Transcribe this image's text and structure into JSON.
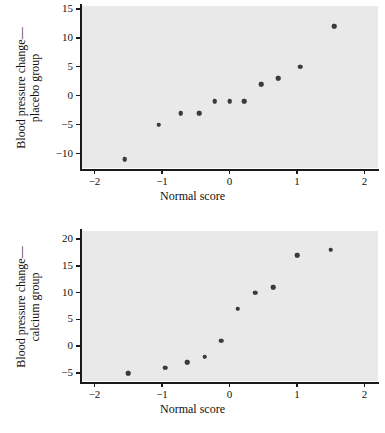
{
  "figure": {
    "background_color": "#ffffff",
    "plot_background_color": "#e9e9e9",
    "point_color": "#3b3b3b",
    "axis_color": "#1a1a1a"
  },
  "chart_data": [
    {
      "id": "placebo",
      "type": "scatter",
      "title": "",
      "xlabel": "Normal score",
      "ylabel_line1": "Blood pressure change—",
      "ylabel_line2": "placebo group",
      "xlim": [
        -2.2,
        2.2
      ],
      "ylim": [
        -12.5,
        15.5
      ],
      "xticks": [
        -2,
        -1,
        0,
        1,
        2
      ],
      "xticklabels": [
        "−2",
        "−1",
        "0",
        "1",
        "2"
      ],
      "yticks": [
        -10,
        -5,
        0,
        5,
        10,
        15
      ],
      "yticklabels": [
        "−10",
        "−5",
        "0",
        "5",
        "10",
        "15"
      ],
      "grid": false,
      "legend": "none",
      "x": [
        -1.55,
        -1.05,
        -0.72,
        -0.45,
        -0.22,
        0.0,
        0.22,
        0.47,
        0.72,
        1.05,
        1.55
      ],
      "y": [
        -11,
        -5,
        -3,
        -3,
        -1,
        -1,
        -1,
        2,
        3,
        5,
        12
      ]
    },
    {
      "id": "calcium",
      "type": "scatter",
      "title": "",
      "xlabel": "Normal score",
      "ylabel_line1": "Blood pressure change—",
      "ylabel_line2": "calcium group",
      "xlim": [
        -2.2,
        2.2
      ],
      "ylim": [
        -6.5,
        21.5
      ],
      "xticks": [
        -2,
        -1,
        0,
        1,
        2
      ],
      "xticklabels": [
        "−2",
        "−1",
        "0",
        "1",
        "2"
      ],
      "yticks": [
        -5,
        0,
        5,
        10,
        15,
        20
      ],
      "yticklabels": [
        "−5",
        "0",
        "5",
        "10",
        "15",
        "20"
      ],
      "grid": false,
      "legend": "none",
      "x": [
        -1.5,
        -0.95,
        -0.63,
        -0.37,
        -0.12,
        0.12,
        0.38,
        0.65,
        1.0,
        1.5
      ],
      "y": [
        -5,
        -4,
        -3,
        -2,
        1,
        7,
        10,
        11,
        17,
        18
      ]
    }
  ]
}
